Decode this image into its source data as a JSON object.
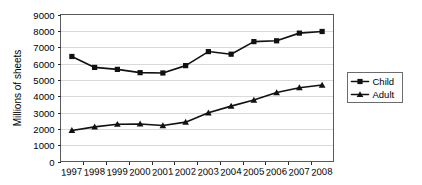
{
  "chart_data": {
    "type": "line",
    "title": "",
    "xlabel": "",
    "ylabel": "Millions of sheets",
    "categories": [
      "1997",
      "1998",
      "1999",
      "2000",
      "2001",
      "2002",
      "2003",
      "2004",
      "2005",
      "2006",
      "2007",
      "2008"
    ],
    "ylim": [
      0,
      9000
    ],
    "ytick_step": 1000,
    "yticks": [
      "0",
      "1000",
      "2000",
      "3000",
      "4000",
      "5000",
      "6000",
      "7000",
      "8000",
      "9000"
    ],
    "grid": "horizontal",
    "legend_position": "right",
    "series": [
      {
        "name": "Child",
        "marker": "square",
        "color": "#111111",
        "values": [
          6430,
          5760,
          5640,
          5440,
          5420,
          5870,
          6730,
          6570,
          7340,
          7390,
          7860,
          7960
        ]
      },
      {
        "name": "Adult",
        "marker": "triangle",
        "color": "#111111",
        "values": [
          1900,
          2120,
          2280,
          2300,
          2200,
          2410,
          2980,
          3390,
          3760,
          4220,
          4520,
          4680
        ]
      }
    ]
  },
  "legend": {
    "entries": [
      {
        "label": "Child"
      },
      {
        "label": "Adult"
      }
    ]
  },
  "axes": {
    "y_title": "Millions of sheets"
  }
}
